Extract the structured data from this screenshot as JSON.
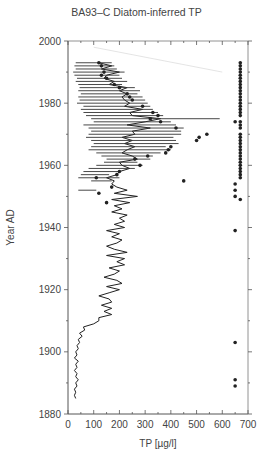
{
  "chart_data": {
    "type": "line",
    "title": "BA93–C Diatom-inferred TP",
    "xlabel": "TP [µg/l]",
    "ylabel": "Year AD",
    "xlim": [
      0,
      700
    ],
    "ylim": [
      1880,
      2000
    ],
    "x_ticks": [
      0,
      100,
      200,
      300,
      400,
      500,
      600,
      700
    ],
    "y_ticks": [
      1880,
      1900,
      1920,
      1940,
      1960,
      1980,
      2000
    ],
    "grid": false,
    "legend": null,
    "series": [
      {
        "name": "Diatom-inferred TP (line)",
        "style": "line",
        "points": [
          [
            120,
            1993
          ],
          [
            170,
            1992
          ],
          [
            130,
            1991
          ],
          [
            200,
            1990
          ],
          [
            150,
            1989
          ],
          [
            140,
            1988
          ],
          [
            180,
            1987
          ],
          [
            160,
            1986
          ],
          [
            230,
            1985
          ],
          [
            200,
            1984
          ],
          [
            230,
            1983
          ],
          [
            210,
            1982
          ],
          [
            220,
            1981
          ],
          [
            240,
            1980
          ],
          [
            220,
            1979
          ],
          [
            290,
            1978
          ],
          [
            240,
            1977
          ],
          [
            250,
            1976
          ],
          [
            360,
            1975
          ],
          [
            300,
            1974
          ],
          [
            230,
            1973
          ],
          [
            320,
            1972
          ],
          [
            250,
            1971
          ],
          [
            260,
            1970
          ],
          [
            210,
            1969
          ],
          [
            250,
            1968
          ],
          [
            220,
            1967
          ],
          [
            260,
            1966
          ],
          [
            230,
            1965
          ],
          [
            210,
            1964
          ],
          [
            250,
            1963
          ],
          [
            270,
            1962
          ],
          [
            200,
            1961
          ],
          [
            210,
            1960
          ],
          [
            240,
            1959
          ],
          [
            200,
            1958
          ],
          [
            190,
            1957
          ],
          [
            150,
            1956
          ],
          [
            180,
            1955
          ],
          [
            170,
            1954
          ],
          [
            190,
            1953
          ],
          [
            230,
            1952
          ],
          [
            180,
            1951
          ],
          [
            270,
            1950
          ],
          [
            170,
            1949
          ],
          [
            240,
            1948
          ],
          [
            180,
            1947
          ],
          [
            210,
            1946
          ],
          [
            170,
            1945
          ],
          [
            230,
            1944
          ],
          [
            200,
            1943
          ],
          [
            220,
            1942
          ],
          [
            180,
            1941
          ],
          [
            220,
            1940
          ],
          [
            150,
            1939
          ],
          [
            200,
            1938
          ],
          [
            170,
            1937
          ],
          [
            210,
            1936
          ],
          [
            190,
            1935
          ],
          [
            150,
            1934
          ],
          [
            180,
            1933
          ],
          [
            230,
            1932
          ],
          [
            150,
            1931
          ],
          [
            220,
            1930
          ],
          [
            190,
            1929
          ],
          [
            220,
            1928
          ],
          [
            160,
            1927
          ],
          [
            200,
            1926
          ],
          [
            180,
            1925
          ],
          [
            140,
            1924
          ],
          [
            190,
            1923
          ],
          [
            210,
            1922
          ],
          [
            150,
            1921
          ],
          [
            200,
            1920
          ],
          [
            160,
            1919
          ],
          [
            120,
            1918
          ],
          [
            160,
            1917
          ],
          [
            170,
            1916
          ],
          [
            130,
            1915
          ],
          [
            170,
            1914
          ],
          [
            140,
            1913
          ],
          [
            170,
            1912
          ],
          [
            120,
            1911
          ],
          [
            120,
            1910
          ],
          [
            100,
            1909
          ],
          [
            60,
            1908
          ],
          [
            65,
            1907
          ],
          [
            45,
            1906
          ],
          [
            55,
            1905
          ],
          [
            40,
            1904
          ],
          [
            45,
            1903
          ],
          [
            35,
            1902
          ],
          [
            40,
            1901
          ],
          [
            30,
            1900
          ],
          [
            35,
            1899
          ],
          [
            25,
            1898
          ],
          [
            40,
            1897
          ],
          [
            30,
            1896
          ],
          [
            35,
            1895
          ],
          [
            25,
            1894
          ],
          [
            35,
            1893
          ],
          [
            30,
            1892
          ],
          [
            40,
            1891
          ],
          [
            30,
            1890
          ],
          [
            35,
            1889
          ],
          [
            25,
            1888
          ],
          [
            30,
            1887
          ],
          [
            25,
            1886
          ],
          [
            30,
            1885
          ]
        ]
      },
      {
        "name": "Error bars (top section)",
        "style": "errorbar",
        "bars": [
          [
            30,
            170,
            1993
          ],
          [
            25,
            180,
            1992
          ],
          [
            30,
            190,
            1991
          ],
          [
            20,
            220,
            1990
          ],
          [
            25,
            200,
            1989
          ],
          [
            35,
            210,
            1988
          ],
          [
            30,
            230,
            1987
          ],
          [
            40,
            210,
            1986
          ],
          [
            45,
            260,
            1985
          ],
          [
            40,
            280,
            1984
          ],
          [
            50,
            270,
            1983
          ],
          [
            40,
            290,
            1982
          ],
          [
            45,
            300,
            1981
          ],
          [
            35,
            310,
            1980
          ],
          [
            60,
            320,
            1979
          ],
          [
            50,
            330,
            1978
          ],
          [
            60,
            350,
            1977
          ],
          [
            70,
            370,
            1976
          ],
          [
            90,
            590,
            1975
          ],
          [
            100,
            400,
            1974
          ],
          [
            60,
            420,
            1973
          ],
          [
            80,
            450,
            1972
          ],
          [
            90,
            440,
            1971
          ],
          [
            80,
            440,
            1970
          ],
          [
            70,
            410,
            1969
          ],
          [
            90,
            420,
            1968
          ],
          [
            100,
            430,
            1967
          ],
          [
            90,
            380,
            1966
          ],
          [
            80,
            400,
            1965
          ],
          [
            110,
            360,
            1964
          ],
          [
            130,
            330,
            1963
          ],
          [
            150,
            320,
            1962
          ],
          [
            140,
            270,
            1961
          ],
          [
            110,
            290,
            1960
          ],
          [
            80,
            260,
            1959
          ],
          [
            60,
            200,
            1958
          ],
          [
            50,
            160,
            1957
          ],
          [
            40,
            200,
            1956
          ],
          [
            90,
            170,
            1955
          ],
          [
            40,
            110,
            1952
          ]
        ]
      },
      {
        "name": "Inferred TP points (dots)",
        "style": "scatter",
        "points": [
          [
            120,
            1993
          ],
          [
            130,
            1992
          ],
          [
            140,
            1990
          ],
          [
            130,
            1989
          ],
          [
            150,
            1988
          ],
          [
            180,
            1986
          ],
          [
            200,
            1985
          ],
          [
            230,
            1983
          ],
          [
            240,
            1982
          ],
          [
            250,
            1981
          ],
          [
            290,
            1979
          ],
          [
            330,
            1977
          ],
          [
            350,
            1976
          ],
          [
            320,
            1975
          ],
          [
            360,
            1974
          ],
          [
            420,
            1972
          ],
          [
            540,
            1970
          ],
          [
            510,
            1969
          ],
          [
            500,
            1968
          ],
          [
            400,
            1966
          ],
          [
            390,
            1965
          ],
          [
            380,
            1964
          ],
          [
            310,
            1963
          ],
          [
            260,
            1962
          ],
          [
            280,
            1960
          ],
          [
            200,
            1958
          ],
          [
            190,
            1957
          ],
          [
            110,
            1956
          ],
          [
            450,
            1955
          ],
          [
            170,
            1953
          ],
          [
            120,
            1951
          ],
          [
            150,
            1948
          ]
        ]
      },
      {
        "name": "Sample dots (right column)",
        "style": "scatter",
        "points": [
          [
            670,
            1993
          ],
          [
            670,
            1992
          ],
          [
            670,
            1991
          ],
          [
            670,
            1990
          ],
          [
            670,
            1989
          ],
          [
            670,
            1988
          ],
          [
            670,
            1987
          ],
          [
            670,
            1986
          ],
          [
            670,
            1985
          ],
          [
            670,
            1984
          ],
          [
            670,
            1983
          ],
          [
            670,
            1982
          ],
          [
            670,
            1981
          ],
          [
            670,
            1980
          ],
          [
            670,
            1979
          ],
          [
            670,
            1978
          ],
          [
            670,
            1977
          ],
          [
            670,
            1976
          ],
          [
            670,
            1974
          ],
          [
            670,
            1973
          ],
          [
            670,
            1972
          ],
          [
            670,
            1970
          ],
          [
            670,
            1969
          ],
          [
            670,
            1968
          ],
          [
            670,
            1967
          ],
          [
            670,
            1966
          ],
          [
            670,
            1965
          ],
          [
            670,
            1964
          ],
          [
            670,
            1963
          ],
          [
            670,
            1962
          ],
          [
            670,
            1961
          ],
          [
            670,
            1960
          ],
          [
            670,
            1959
          ],
          [
            670,
            1958
          ],
          [
            670,
            1957
          ],
          [
            670,
            1956
          ],
          [
            650,
            1974
          ],
          [
            650,
            1954
          ],
          [
            650,
            1952
          ],
          [
            650,
            1950
          ],
          [
            670,
            1949
          ],
          [
            650,
            1939
          ],
          [
            650,
            1903
          ],
          [
            650,
            1891
          ],
          [
            650,
            1889
          ]
        ]
      },
      {
        "name": "Trend line (faint)",
        "style": "faint-line",
        "points": [
          [
            100,
            1998
          ],
          [
            600,
            1990
          ]
        ]
      }
    ]
  }
}
